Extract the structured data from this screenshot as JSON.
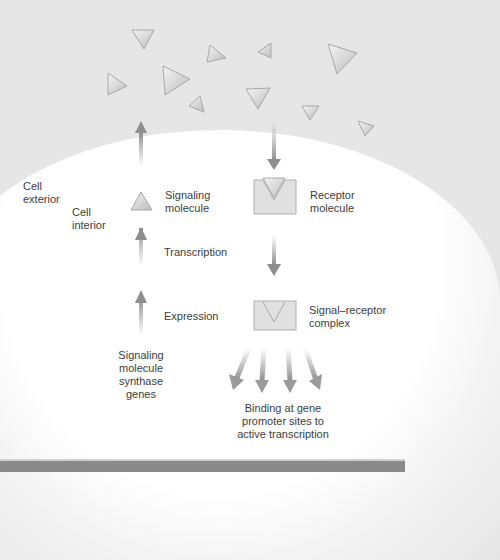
{
  "labels": {
    "cell_exterior": "Cell\nexterior",
    "cell_interior": "Cell\ninterior",
    "signaling_molecule": "Signaling\nmolecule",
    "receptor_molecule": "Receptor\nmolecule",
    "transcription": "Transcription",
    "expression": "Expression",
    "signal_receptor_complex": "Signal–receptor\ncomplex",
    "synthase_genes": "Signaling\nmolecule\nsynthase\ngenes",
    "binding": "Binding at gene\npromoter sites to\nactive transcription"
  },
  "colors": {
    "background": "#e6e6e6",
    "triangle_fill": "#d4d4d4",
    "triangle_stroke": "#a8a8a8",
    "arrow": "#9a9a9a",
    "text": "#3c3c3c",
    "bottom_bar": "#8a8a8a"
  }
}
